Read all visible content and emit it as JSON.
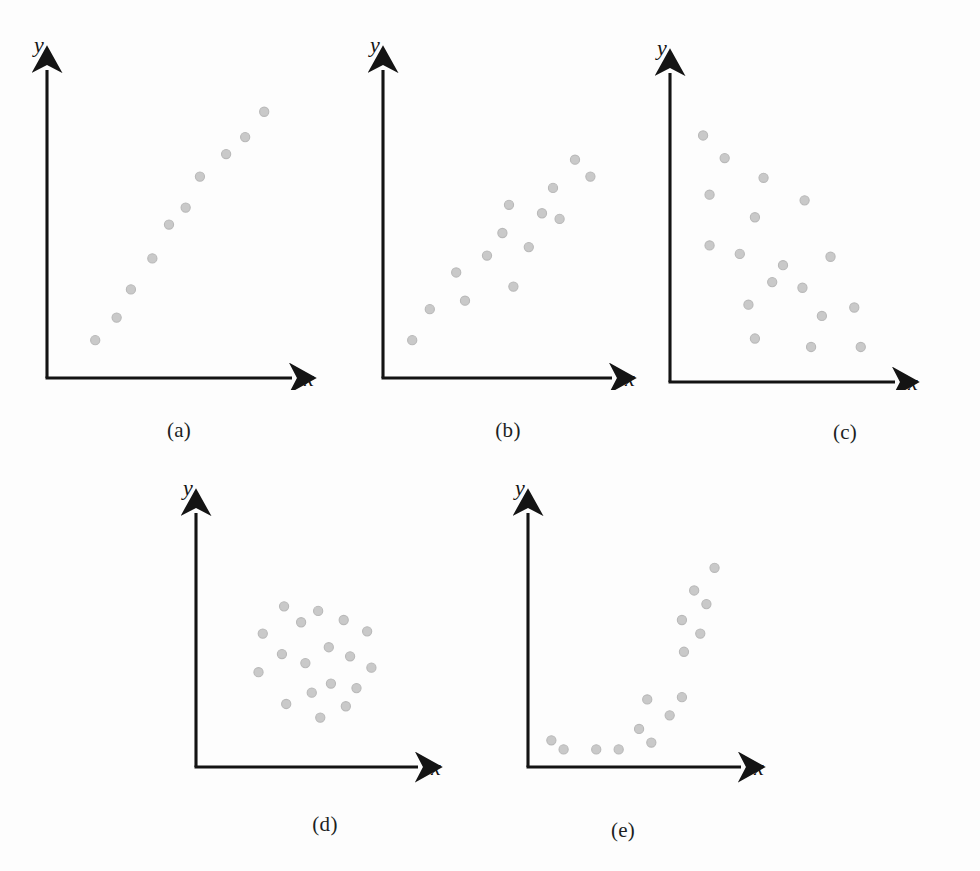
{
  "figure": {
    "background_color": "#fdfdfd",
    "axis_color": "#141414",
    "point_fill": "#c9c9c9",
    "point_stroke": "#b9b9b9",
    "point_radius": 4.6
  },
  "axis_labels": {
    "x": "x",
    "y": "y"
  },
  "captions": {
    "a": "(a)",
    "b": "(b)",
    "c": "(c)",
    "d": "(d)",
    "e": "(e)"
  },
  "chart_data": [
    {
      "id": "a",
      "type": "scatter",
      "title": "(a)",
      "xlabel": "x",
      "ylabel": "y",
      "grid": false,
      "legend": "none",
      "xlim": [
        0,
        100
      ],
      "ylim": [
        0,
        100
      ],
      "description": "strong positive linear relationship",
      "points": [
        {
          "x": 19,
          "y": 12
        },
        {
          "x": 28,
          "y": 20
        },
        {
          "x": 34,
          "y": 30
        },
        {
          "x": 43,
          "y": 41
        },
        {
          "x": 50,
          "y": 53
        },
        {
          "x": 57,
          "y": 59
        },
        {
          "x": 63,
          "y": 70
        },
        {
          "x": 74,
          "y": 78
        },
        {
          "x": 82,
          "y": 84
        },
        {
          "x": 90,
          "y": 93
        }
      ]
    },
    {
      "id": "b",
      "type": "scatter",
      "title": "(b)",
      "xlabel": "x",
      "ylabel": "y",
      "grid": false,
      "legend": "none",
      "xlim": [
        0,
        100
      ],
      "ylim": [
        0,
        100
      ],
      "description": "moderate positive linear relationship",
      "points": [
        {
          "x": 11,
          "y": 12
        },
        {
          "x": 19,
          "y": 23
        },
        {
          "x": 31,
          "y": 36
        },
        {
          "x": 35,
          "y": 26
        },
        {
          "x": 45,
          "y": 42
        },
        {
          "x": 52,
          "y": 50
        },
        {
          "x": 55,
          "y": 60
        },
        {
          "x": 57,
          "y": 31
        },
        {
          "x": 64,
          "y": 45
        },
        {
          "x": 70,
          "y": 57
        },
        {
          "x": 75,
          "y": 66
        },
        {
          "x": 78,
          "y": 55
        },
        {
          "x": 85,
          "y": 76
        },
        {
          "x": 92,
          "y": 70
        }
      ]
    },
    {
      "id": "c",
      "type": "scatter",
      "title": "(c)",
      "xlabel": "x",
      "ylabel": "y",
      "grid": false,
      "legend": "none",
      "xlim": [
        0,
        100
      ],
      "ylim": [
        0,
        100
      ],
      "description": "moderate negative linear relationship",
      "points": [
        {
          "x": 13,
          "y": 86
        },
        {
          "x": 23,
          "y": 78
        },
        {
          "x": 41,
          "y": 71
        },
        {
          "x": 16,
          "y": 65
        },
        {
          "x": 60,
          "y": 63
        },
        {
          "x": 37,
          "y": 57
        },
        {
          "x": 16,
          "y": 47
        },
        {
          "x": 30,
          "y": 44
        },
        {
          "x": 72,
          "y": 43
        },
        {
          "x": 50,
          "y": 40
        },
        {
          "x": 45,
          "y": 34
        },
        {
          "x": 59,
          "y": 32
        },
        {
          "x": 34,
          "y": 26
        },
        {
          "x": 83,
          "y": 25
        },
        {
          "x": 68,
          "y": 22
        },
        {
          "x": 37,
          "y": 14
        },
        {
          "x": 63,
          "y": 11
        },
        {
          "x": 86,
          "y": 11
        }
      ]
    },
    {
      "id": "d",
      "type": "scatter",
      "title": "(d)",
      "xlabel": "x",
      "ylabel": "y",
      "grid": false,
      "legend": "none",
      "xlim": [
        0,
        100
      ],
      "ylim": [
        0,
        100
      ],
      "description": "no relationship between x and y",
      "points": [
        {
          "x": 39,
          "y": 69
        },
        {
          "x": 55,
          "y": 67
        },
        {
          "x": 67,
          "y": 63
        },
        {
          "x": 47,
          "y": 62
        },
        {
          "x": 78,
          "y": 58
        },
        {
          "x": 29,
          "y": 57
        },
        {
          "x": 60,
          "y": 51
        },
        {
          "x": 38,
          "y": 48
        },
        {
          "x": 70,
          "y": 47
        },
        {
          "x": 49,
          "y": 44
        },
        {
          "x": 80,
          "y": 42
        },
        {
          "x": 27,
          "y": 40
        },
        {
          "x": 61,
          "y": 35
        },
        {
          "x": 73,
          "y": 33
        },
        {
          "x": 52,
          "y": 31
        },
        {
          "x": 40,
          "y": 26
        },
        {
          "x": 68,
          "y": 25
        },
        {
          "x": 56,
          "y": 20
        }
      ]
    },
    {
      "id": "e",
      "type": "scatter",
      "title": "(e)",
      "xlabel": "x",
      "ylabel": "y",
      "grid": false,
      "legend": "none",
      "xlim": [
        0,
        100
      ],
      "ylim": [
        0,
        100
      ],
      "description": "nonlinear (curvilinear) relationship",
      "points": [
        {
          "x": 9,
          "y": 10
        },
        {
          "x": 15,
          "y": 6
        },
        {
          "x": 31,
          "y": 6
        },
        {
          "x": 42,
          "y": 6
        },
        {
          "x": 52,
          "y": 15
        },
        {
          "x": 58,
          "y": 9
        },
        {
          "x": 56,
          "y": 28
        },
        {
          "x": 67,
          "y": 21
        },
        {
          "x": 73,
          "y": 29
        },
        {
          "x": 74,
          "y": 49
        },
        {
          "x": 73,
          "y": 63
        },
        {
          "x": 82,
          "y": 57
        },
        {
          "x": 79,
          "y": 76
        },
        {
          "x": 85,
          "y": 70
        },
        {
          "x": 89,
          "y": 86
        }
      ]
    }
  ]
}
